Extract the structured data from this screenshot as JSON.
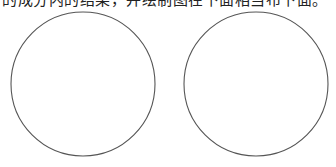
{
  "caption": {
    "text": "的成分内的结果，并绘制图在下面相当布下面。",
    "cropped": true
  },
  "figure": {
    "stroke_color": "#555555",
    "circles": [
      {
        "id": "left-circle",
        "cx": 83,
        "cy": 84,
        "r": 72
      },
      {
        "id": "right-circle",
        "cx": 256,
        "cy": 84,
        "r": 72
      }
    ]
  }
}
